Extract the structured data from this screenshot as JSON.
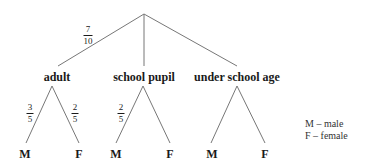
{
  "diagram": {
    "type": "probability-tree",
    "root_branches": [
      {
        "label": "adult",
        "probability": {
          "num": "7",
          "den": "10"
        }
      },
      {
        "label": "school pupil",
        "probability": null
      },
      {
        "label": "under school age",
        "probability": null
      }
    ],
    "sub_branches": {
      "adult": {
        "M": {
          "num": "3",
          "den": "5"
        },
        "F": {
          "num": "2",
          "den": "5"
        }
      },
      "school_pupil": {
        "M": {
          "num": "2",
          "den": "5"
        },
        "F": null
      },
      "under_school_age": {
        "M": null,
        "F": null
      }
    },
    "leaf_labels": {
      "male": "M",
      "female": "F"
    },
    "legend": [
      "M – male",
      "F – female"
    ],
    "line_color": "#777777"
  }
}
